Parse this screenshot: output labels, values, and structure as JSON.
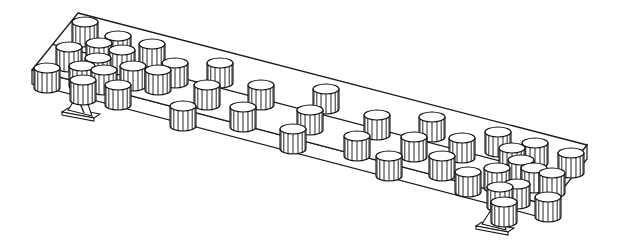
{
  "figure": {
    "description": "Isometric line drawing of a long rectangular plate resting on two pedestal supports, loaded with cylindrical weights",
    "stroke_color": "#1a1a1a",
    "background": "#ffffff"
  },
  "plate": {
    "top_face": [
      [
        78,
        13
      ],
      [
        587,
        145
      ],
      [
        540,
        203
      ],
      [
        32,
        70
      ]
    ],
    "thickness": 14
  },
  "supports": [
    {
      "name": "left-support",
      "x": 80,
      "y": 104
    },
    {
      "name": "right-support",
      "x": 494,
      "y": 218
    }
  ],
  "cylinders": [
    [
      85,
      22
    ],
    [
      118,
      36
    ],
    [
      152,
      44
    ],
    [
      99,
      43
    ],
    [
      122,
      50
    ],
    [
      69,
      47
    ],
    [
      98,
      58
    ],
    [
      104,
      70
    ],
    [
      158,
      70
    ],
    [
      133,
      66
    ],
    [
      47,
      68
    ],
    [
      82,
      66
    ],
    [
      83,
      80
    ],
    [
      118,
      85
    ],
    [
      175,
      63
    ],
    [
      183,
      106
    ],
    [
      207,
      85
    ],
    [
      261,
      85
    ],
    [
      243,
      107
    ],
    [
      220,
      63
    ],
    [
      326,
      89
    ],
    [
      293,
      129
    ],
    [
      310,
      110
    ],
    [
      357,
      136
    ],
    [
      377,
      115
    ],
    [
      389,
      156
    ],
    [
      414,
      137
    ],
    [
      432,
      117
    ],
    [
      462,
      138
    ],
    [
      442,
      156
    ],
    [
      468,
      172
    ],
    [
      498,
      132
    ],
    [
      512,
      148
    ],
    [
      535,
      143
    ],
    [
      521,
      160
    ],
    [
      497,
      168
    ],
    [
      517,
      184
    ],
    [
      500,
      187
    ],
    [
      534,
      168
    ],
    [
      552,
      173
    ],
    [
      571,
      153
    ],
    [
      548,
      197
    ],
    [
      504,
      202
    ]
  ]
}
